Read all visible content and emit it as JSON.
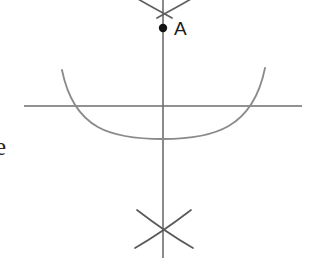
{
  "figure": {
    "background_color": "#ffffff",
    "stroke_color": "#6d6d6d",
    "point_color": "#141414",
    "label_color": "#1c1c1c",
    "canvas": {
      "width": 310,
      "height": 258
    }
  },
  "labels": {
    "point_a": "A",
    "clipped_edge_letter": "e"
  },
  "elements": {
    "vertical_line": {
      "name": "vertical-construction-line",
      "x": 163,
      "y_start": 0,
      "y_end": 258
    },
    "horizontal_line": {
      "name": "horizontal-construction-line",
      "y": 106,
      "x_start": 24,
      "x_end": 302
    },
    "point_a": {
      "name": "point-a",
      "x": 163,
      "y": 28,
      "radius": 4.2
    },
    "main_arc": {
      "name": "main-arc",
      "left_end": {
        "x": 62,
        "y": 70
      },
      "right_end": {
        "x": 265,
        "y": 68
      },
      "bottom": {
        "x": 163,
        "y": 139
      },
      "left_crossing_x": 86,
      "right_crossing_x": 242
    },
    "top_cross_arc_left": {
      "name": "top-cross-arc-left",
      "from": {
        "x": 133,
        "y": 0
      },
      "to": {
        "x": 170,
        "y": 16
      }
    },
    "top_cross_arc_right": {
      "name": "top-cross-arc-right",
      "from": {
        "x": 196,
        "y": 0
      },
      "to": {
        "x": 158,
        "y": 16
      }
    },
    "bottom_cross_arc_left": {
      "name": "bottom-cross-arc-left",
      "from": {
        "x": 137,
        "y": 210
      },
      "to": {
        "x": 192,
        "y": 248
      },
      "crossing": {
        "x": 163,
        "y": 228
      }
    },
    "bottom_cross_arc_right": {
      "name": "bottom-cross-arc-right",
      "from": {
        "x": 191,
        "y": 210
      },
      "to": {
        "x": 136,
        "y": 248
      },
      "crossing": {
        "x": 163,
        "y": 228
      }
    }
  }
}
